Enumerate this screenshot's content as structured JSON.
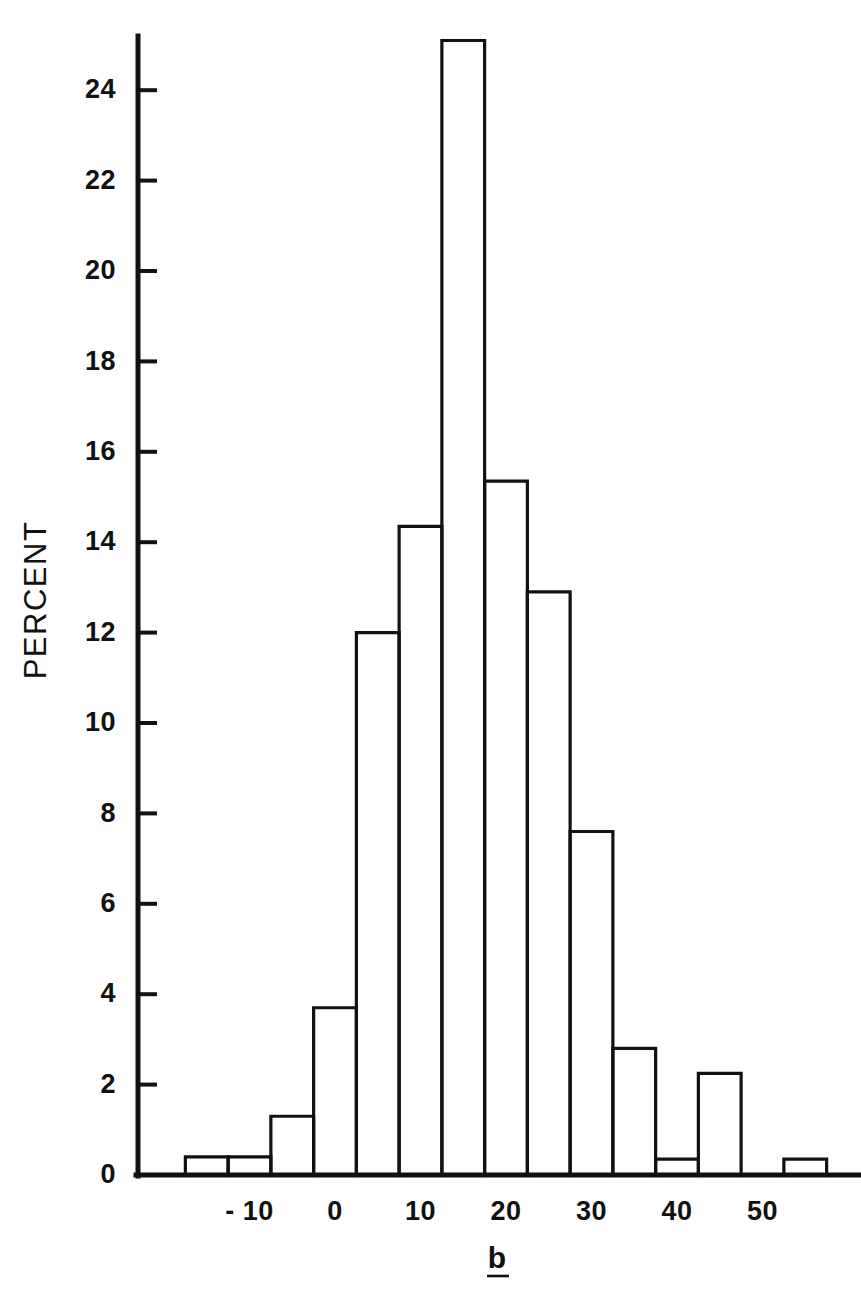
{
  "figure": {
    "background_color": "#ffffff",
    "ink_color": "#111111"
  },
  "axes": {
    "y_title": "PERCENT",
    "x_title": "b",
    "x_title_underlined": true,
    "y_ticks": [
      "0",
      "2",
      "4",
      "6",
      "8",
      "10",
      "12",
      "14",
      "16",
      "18",
      "20",
      "22",
      "24"
    ],
    "y_tick_values": [
      0,
      2,
      4,
      6,
      8,
      10,
      12,
      14,
      16,
      18,
      20,
      22,
      24
    ],
    "x_ticks": [
      "- 10",
      "0",
      "10",
      "20",
      "30",
      "40",
      "50"
    ],
    "x_tick_values": [
      -10,
      0,
      10,
      20,
      30,
      40,
      50
    ]
  },
  "chart_data": {
    "type": "bar",
    "title": "",
    "subtitle": "",
    "xlabel": "b",
    "ylabel": "PERCENT",
    "xlim": [
      -17.5,
      57.5
    ],
    "ylim": [
      0,
      25.6
    ],
    "grid": false,
    "legend": null,
    "bin_width": 5,
    "bin_starts": [
      -17.5,
      -12.5,
      -7.5,
      -2.5,
      2.5,
      7.5,
      12.5,
      17.5,
      22.5,
      27.5,
      32.5,
      37.5,
      42.5,
      47.5,
      52.5
    ],
    "bin_centers": [
      -15,
      -10,
      -5,
      0,
      5,
      10,
      15,
      20,
      25,
      30,
      35,
      40,
      45,
      50,
      55
    ],
    "categories": [
      "-17.5 to -12.5",
      "-12.5 to -7.5",
      "-7.5 to -2.5",
      "-2.5 to 2.5",
      "2.5 to 7.5",
      "7.5 to 12.5",
      "12.5 to 17.5",
      "17.5 to 22.5",
      "22.5 to 27.5",
      "27.5 to 32.5",
      "32.5 to 37.5",
      "37.5 to 42.5",
      "42.5 to 47.5",
      "47.5 to 52.5",
      "52.5 to 57.5"
    ],
    "values": [
      0.4,
      0.4,
      1.3,
      3.7,
      12.0,
      14.35,
      25.1,
      15.35,
      12.9,
      7.6,
      2.8,
      0.35,
      2.25,
      0,
      0.35
    ],
    "series": [
      {
        "name": "PERCENT",
        "values": [
          0.4,
          0.4,
          1.3,
          3.7,
          12.0,
          14.35,
          25.1,
          15.35,
          12.9,
          7.6,
          2.8,
          0.35,
          2.25,
          0,
          0.35
        ]
      }
    ]
  }
}
